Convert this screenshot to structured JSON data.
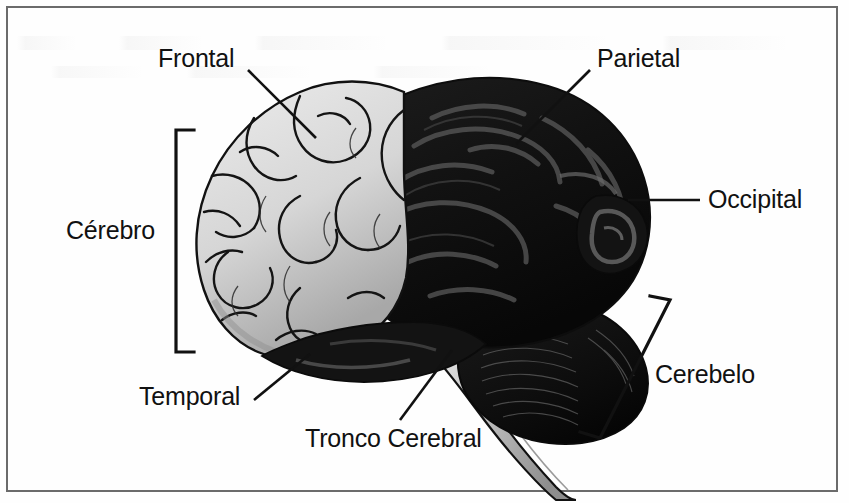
{
  "figure": {
    "kind": "anatomical-diagram",
    "language": "pt-BR",
    "border_color": "#6b6b6b",
    "background_color": "#fefefe"
  },
  "colors": {
    "ink": "#111111",
    "leader_line": "#111111",
    "bracket": "#111111",
    "cerebrum_light_fill": "#dcdcdc",
    "cerebrum_light_shadow": "#9a9a9a",
    "cerebrum_dark_fill": "#151515",
    "cerebrum_dark_highlight": "#5a5a5a",
    "cerebellum_fill": "#101010",
    "brainstem_fill": "#c9c9c9",
    "outline": "#111111"
  },
  "labels": [
    {
      "id": "frontal",
      "text": "Frontal",
      "icon": "leader-line-icon",
      "x": 158,
      "y": 44,
      "marker": "leader-line",
      "points_to": "lobo-frontal"
    },
    {
      "id": "parietal",
      "text": "Parietal",
      "icon": "leader-line-icon",
      "x": 597,
      "y": 44,
      "marker": "leader-line",
      "points_to": "lobo-parietal"
    },
    {
      "id": "occipital",
      "text": "Occipital",
      "icon": "leader-line-icon",
      "x": 708,
      "y": 185,
      "marker": "leader-line",
      "points_to": "lobo-occipital"
    },
    {
      "id": "temporal",
      "text": "Temporal",
      "icon": "leader-line-icon",
      "x": 139,
      "y": 382,
      "marker": "leader-line",
      "points_to": "lobo-temporal"
    },
    {
      "id": "tronco-cerebral",
      "text": "Tronco Cerebral",
      "icon": "leader-line-icon",
      "x": 305,
      "y": 424,
      "marker": "leader-line",
      "points_to": "tronco-encefalico"
    },
    {
      "id": "cerebro",
      "text": "Cérebro",
      "icon": "bracket-icon",
      "x": 66,
      "y": 216,
      "marker": "bracket-vertical",
      "points_to": "cerebro-regiao"
    },
    {
      "id": "cerebelo",
      "text": "Cerebelo",
      "icon": "bracket-icon",
      "x": 655,
      "y": 360,
      "marker": "bracket-tilted",
      "points_to": "cerebelo-regiao"
    }
  ],
  "structures": [
    {
      "id": "lobo-frontal",
      "name": "Lobo frontal",
      "shading": "light"
    },
    {
      "id": "lobo-parietal",
      "name": "Lobo parietal",
      "shading": "dark"
    },
    {
      "id": "lobo-occipital",
      "name": "Lobo occipital",
      "shading": "dark"
    },
    {
      "id": "lobo-temporal",
      "name": "Lobo temporal",
      "shading": "dark"
    },
    {
      "id": "cerebelo-regiao",
      "name": "Cerebelo",
      "shading": "dark"
    },
    {
      "id": "tronco-encefalico",
      "name": "Tronco cerebral",
      "shading": "light"
    }
  ]
}
